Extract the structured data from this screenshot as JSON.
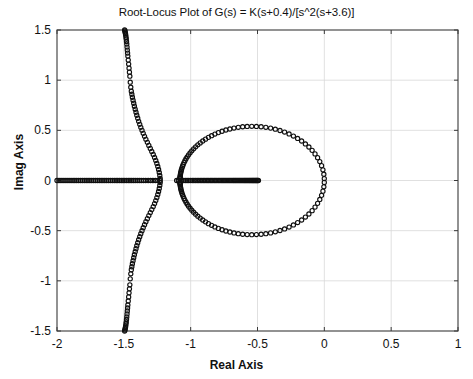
{
  "chart_data": {
    "type": "scatter",
    "title": "Root-Locus Plot of G(s) = K(s+0.4)/[s^2(s+3.6)]",
    "xlabel": "Real Axis",
    "ylabel": "Imag Axis",
    "xlim": [
      -2,
      1
    ],
    "ylim": [
      -1.5,
      1.5
    ],
    "xticks": [
      "-2",
      "-1.5",
      "-1",
      "-0.5",
      "0",
      "0.5",
      "1"
    ],
    "xtick_values": [
      -2,
      -1.5,
      -1,
      -0.5,
      0,
      0.5,
      1
    ],
    "yticks": [
      "1.5",
      "1",
      "0.5",
      "0",
      "-0.5",
      "-1",
      "-1.5"
    ],
    "ytick_values": [
      1.5,
      1,
      0.5,
      0,
      -0.5,
      -1,
      -1.5
    ],
    "grid": true,
    "legend": null,
    "marker": "open-circle",
    "marker_size": 4.2,
    "marker_color": "#101010",
    "transfer_function": {
      "numerator_zero": -0.4,
      "denominator_poles": [
        0,
        0,
        -3.6
      ],
      "gain_symbol": "K"
    },
    "series": [
      {
        "name": "real-axis-locus-left",
        "comment": "Real axis segment running from left frame edge toward the breakaway near -1.25; dense at left, sparsening rightward.",
        "x": [
          -2.0,
          -1.985,
          -1.97,
          -1.955,
          -1.94,
          -1.925,
          -1.91,
          -1.895,
          -1.88,
          -1.866,
          -1.852,
          -1.838,
          -1.824,
          -1.81,
          -1.796,
          -1.782,
          -1.768,
          -1.754,
          -1.74,
          -1.726,
          -1.712,
          -1.698,
          -1.684,
          -1.67,
          -1.656,
          -1.642,
          -1.628,
          -1.614,
          -1.6,
          -1.586,
          -1.572,
          -1.558,
          -1.545,
          -1.532,
          -1.519,
          -1.506,
          -1.493,
          -1.48,
          -1.467,
          -1.454,
          -1.441,
          -1.428,
          -1.415,
          -1.4,
          -1.385,
          -1.37,
          -1.353,
          -1.336,
          -1.318,
          -1.3,
          -1.282,
          -1.264,
          -1.246,
          -1.228
        ],
        "y": [
          0,
          0,
          0,
          0,
          0,
          0,
          0,
          0,
          0,
          0,
          0,
          0,
          0,
          0,
          0,
          0,
          0,
          0,
          0,
          0,
          0,
          0,
          0,
          0,
          0,
          0,
          0,
          0,
          0,
          0,
          0,
          0,
          0,
          0,
          0,
          0,
          0,
          0,
          0,
          0,
          0,
          0,
          0,
          0,
          0,
          0,
          0,
          0,
          0,
          0,
          0,
          0,
          0,
          0
        ]
      },
      {
        "name": "real-axis-locus-middle",
        "comment": "Real axis segment between about -1.10 and -0.49, dense with a few sparse markers at its left end.",
        "x": [
          -1.105,
          -1.092,
          -1.079,
          -1.066,
          -1.053,
          -1.04,
          -1.027,
          -1.014,
          -1.001,
          -0.988,
          -0.976,
          -0.964,
          -0.952,
          -0.94,
          -0.929,
          -0.918,
          -0.907,
          -0.896,
          -0.885,
          -0.874,
          -0.864,
          -0.854,
          -0.844,
          -0.834,
          -0.824,
          -0.814,
          -0.804,
          -0.794,
          -0.784,
          -0.774,
          -0.765,
          -0.756,
          -0.747,
          -0.738,
          -0.729,
          -0.72,
          -0.711,
          -0.702,
          -0.693,
          -0.684,
          -0.676,
          -0.668,
          -0.66,
          -0.652,
          -0.644,
          -0.636,
          -0.628,
          -0.62,
          -0.612,
          -0.604,
          -0.597,
          -0.59,
          -0.583,
          -0.576,
          -0.569,
          -0.562,
          -0.555,
          -0.548,
          -0.541,
          -0.534,
          -0.528,
          -0.522,
          -0.516,
          -0.51,
          -0.504,
          -0.498,
          -0.493
        ],
        "y": [
          0,
          0,
          0,
          0,
          0,
          0,
          0,
          0,
          0,
          0,
          0,
          0,
          0,
          0,
          0,
          0,
          0,
          0,
          0,
          0,
          0,
          0,
          0,
          0,
          0,
          0,
          0,
          0,
          0,
          0,
          0,
          0,
          0,
          0,
          0,
          0,
          0,
          0,
          0,
          0,
          0,
          0,
          0,
          0,
          0,
          0,
          0,
          0,
          0,
          0,
          0,
          0,
          0,
          0,
          0,
          0,
          0,
          0,
          0,
          0,
          0,
          0,
          0,
          0,
          0,
          0,
          0
        ]
      },
      {
        "name": "upper-asymptote-branch",
        "comment": "Branch leaving real axis near -1.25 going up-left to the top frame edge at about -1.49; dense through the mid portion, sparse near the top.",
        "x": [
          -1.228,
          -1.231,
          -1.235,
          -1.24,
          -1.246,
          -1.253,
          -1.261,
          -1.27,
          -1.28,
          -1.291,
          -1.302,
          -1.313,
          -1.324,
          -1.335,
          -1.345,
          -1.355,
          -1.364,
          -1.373,
          -1.381,
          -1.389,
          -1.396,
          -1.403,
          -1.409,
          -1.415,
          -1.421,
          -1.426,
          -1.431,
          -1.436,
          -1.44,
          -1.444,
          -1.448,
          -1.452,
          -1.455,
          -1.458,
          -1.461,
          -1.464,
          -1.467,
          -1.47,
          -1.472,
          -1.474,
          -1.476,
          -1.478,
          -1.48,
          -1.482,
          -1.484,
          -1.486,
          -1.488,
          -1.49,
          -1.492,
          -1.494
        ],
        "y": [
          0.02,
          0.05,
          0.08,
          0.11,
          0.14,
          0.17,
          0.2,
          0.23,
          0.26,
          0.29,
          0.32,
          0.35,
          0.38,
          0.41,
          0.44,
          0.47,
          0.5,
          0.53,
          0.56,
          0.59,
          0.62,
          0.65,
          0.68,
          0.71,
          0.74,
          0.77,
          0.8,
          0.83,
          0.86,
          0.89,
          0.93,
          0.98,
          1.04,
          1.08,
          1.12,
          1.16,
          1.2,
          1.24,
          1.27,
          1.3,
          1.33,
          1.36,
          1.385,
          1.41,
          1.43,
          1.45,
          1.465,
          1.478,
          1.49,
          1.5
        ]
      },
      {
        "name": "lower-asymptote-branch",
        "comment": "Conjugate mirror of the upper asymptote branch, going down-left to the bottom frame edge.",
        "x": [
          -1.228,
          -1.231,
          -1.235,
          -1.24,
          -1.246,
          -1.253,
          -1.261,
          -1.27,
          -1.28,
          -1.291,
          -1.302,
          -1.313,
          -1.324,
          -1.335,
          -1.345,
          -1.355,
          -1.364,
          -1.373,
          -1.381,
          -1.389,
          -1.396,
          -1.403,
          -1.409,
          -1.415,
          -1.421,
          -1.426,
          -1.431,
          -1.436,
          -1.44,
          -1.444,
          -1.448,
          -1.452,
          -1.455,
          -1.458,
          -1.461,
          -1.464,
          -1.467,
          -1.47,
          -1.472,
          -1.474,
          -1.476,
          -1.478,
          -1.48,
          -1.482,
          -1.484,
          -1.486,
          -1.488,
          -1.49,
          -1.492,
          -1.494
        ],
        "y": [
          -0.02,
          -0.05,
          -0.08,
          -0.11,
          -0.14,
          -0.17,
          -0.2,
          -0.23,
          -0.26,
          -0.29,
          -0.32,
          -0.35,
          -0.38,
          -0.41,
          -0.44,
          -0.47,
          -0.5,
          -0.53,
          -0.56,
          -0.59,
          -0.62,
          -0.65,
          -0.68,
          -0.71,
          -0.74,
          -0.77,
          -0.8,
          -0.83,
          -0.86,
          -0.89,
          -0.93,
          -0.98,
          -1.04,
          -1.08,
          -1.12,
          -1.16,
          -1.2,
          -1.24,
          -1.27,
          -1.3,
          -1.33,
          -1.36,
          -1.385,
          -1.41,
          -1.43,
          -1.45,
          -1.465,
          -1.478,
          -1.49,
          -1.5
        ]
      },
      {
        "name": "circular-locus-upper",
        "comment": "Upper half of the circular locus centred near -0.54 with radius about 0.54, from the breakaway at about -1.08 round to the origin.",
        "circle": {
          "center_real": -0.54,
          "center_imag": 0,
          "radius": 0.54,
          "half": "upper"
        },
        "theta_start_deg": 178,
        "theta_end_deg": 2,
        "n_points": 58
      },
      {
        "name": "circular-locus-lower",
        "comment": "Lower half of the circular locus, conjugate mirror of the upper half.",
        "circle": {
          "center_real": -0.54,
          "center_imag": 0,
          "radius": 0.54,
          "half": "lower"
        },
        "theta_start_deg": 182,
        "theta_end_deg": 358,
        "n_points": 58
      }
    ]
  },
  "plot_frame": {
    "left_px": 57,
    "right_px": 458,
    "top_px": 30,
    "bottom_px": 331,
    "border_color": "#3a3a3a",
    "grid_color": "#d8d8d8",
    "background": "#ffffff"
  }
}
